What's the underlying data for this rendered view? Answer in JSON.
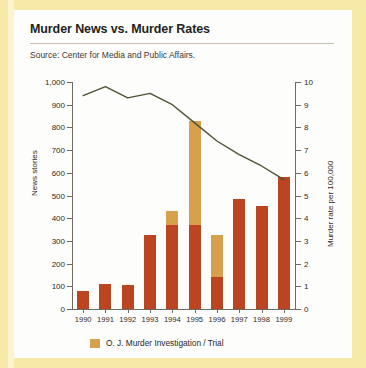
{
  "title": "Murder News vs. Murder Rates",
  "source": "Source: Center for Media and Public Affairs.",
  "legend": {
    "oj_label": "O. J. Murder Investigation / Trial",
    "oj_color": "#d6a04c",
    "news_color": "#bb4521",
    "rate_color": "#4e5234"
  },
  "chart_data": {
    "type": "bar",
    "title": "Murder News vs. Murder Rates",
    "subtitle": "Source: Center for Media and Public Affairs.",
    "categories": [
      "1990",
      "1991",
      "1992",
      "1993",
      "1994",
      "1995",
      "1996",
      "1997",
      "1998",
      "1999"
    ],
    "xlabel": "",
    "ylabel": "News stories",
    "ylim": [
      0,
      1000
    ],
    "yticks": [
      0,
      100,
      200,
      300,
      400,
      500,
      600,
      700,
      800,
      900,
      1000
    ],
    "ytick_labels": [
      "0",
      "100",
      "200",
      "300",
      "400",
      "500",
      "600",
      "700",
      "800",
      "900",
      "1,000"
    ],
    "y2label": "Murder rate per 100,000",
    "y2lim": [
      0,
      10
    ],
    "y2ticks": [
      0,
      1,
      2,
      3,
      4,
      5,
      6,
      7,
      8,
      9,
      10
    ],
    "y2tick_labels": [
      "0",
      "1",
      "2",
      "3",
      "4",
      "5",
      "6",
      "7",
      "8",
      "9",
      "10"
    ],
    "grid": false,
    "legend_position": "bottom-left",
    "series": [
      {
        "name": "News stories (non-O.J.)",
        "type": "bar",
        "color": "#bb4521",
        "axis": "left",
        "values": [
          80,
          108,
          105,
          325,
          370,
          370,
          140,
          485,
          455,
          580
        ]
      },
      {
        "name": "O. J. Murder Investigation / Trial",
        "type": "bar",
        "color": "#d6a04c",
        "axis": "left",
        "stacked": true,
        "values": [
          0,
          0,
          0,
          0,
          60,
          460,
          185,
          0,
          0,
          0
        ]
      },
      {
        "name": "Murder rate per 100,000",
        "type": "line",
        "color": "#4e5234",
        "axis": "right",
        "values": [
          9.4,
          9.8,
          9.3,
          9.5,
          9.0,
          8.2,
          7.4,
          6.8,
          6.3,
          5.7
        ]
      }
    ],
    "bar_totals": [
      80,
      108,
      105,
      325,
      430,
      830,
      325,
      485,
      455,
      580
    ]
  }
}
